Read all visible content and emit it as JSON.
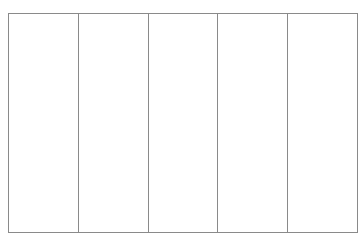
{
  "grid": {
    "columns": 5,
    "rows": 1,
    "cells": [
      "",
      "",
      "",
      "",
      ""
    ],
    "border_color": "#8a8a8a",
    "background": "#ffffff"
  }
}
